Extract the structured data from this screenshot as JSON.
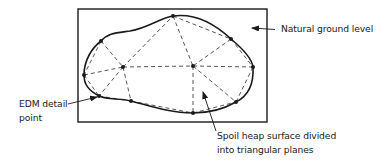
{
  "diagram": {
    "frame": {
      "x": 78,
      "y": 9,
      "w": 189,
      "h": 113
    },
    "colors": {
      "stroke": "#1a1a1a",
      "dash": "#444444",
      "text": "#222222",
      "background": "#ffffff"
    },
    "points": [
      {
        "id": "P1",
        "x": 101,
        "y": 41
      },
      {
        "id": "P2",
        "x": 84,
        "y": 75
      },
      {
        "id": "P3",
        "x": 123,
        "y": 67
      },
      {
        "id": "P4",
        "x": 173,
        "y": 16
      },
      {
        "id": "P5",
        "x": 231,
        "y": 39
      },
      {
        "id": "P6",
        "x": 253,
        "y": 67
      },
      {
        "id": "P7",
        "x": 193,
        "y": 66
      },
      {
        "id": "P8",
        "x": 99,
        "y": 96
      },
      {
        "id": "P9",
        "x": 131,
        "y": 101
      },
      {
        "id": "P10",
        "x": 193,
        "y": 113
      },
      {
        "id": "P11",
        "x": 236,
        "y": 102
      }
    ],
    "triangle_edges": [
      [
        "P1",
        "P2"
      ],
      [
        "P1",
        "P3"
      ],
      [
        "P2",
        "P3"
      ],
      [
        "P3",
        "P4"
      ],
      [
        "P3",
        "P7"
      ],
      [
        "P4",
        "P7"
      ],
      [
        "P4",
        "P5"
      ],
      [
        "P5",
        "P7"
      ],
      [
        "P5",
        "P6"
      ],
      [
        "P6",
        "P7"
      ],
      [
        "P2",
        "P8"
      ],
      [
        "P3",
        "P8"
      ],
      [
        "P3",
        "P9"
      ],
      [
        "P8",
        "P9"
      ],
      [
        "P7",
        "P10"
      ],
      [
        "P7",
        "P11"
      ],
      [
        "P6",
        "P11"
      ],
      [
        "P10",
        "P11"
      ],
      [
        "P9",
        "P10"
      ]
    ],
    "labels": {
      "natural_ground": "Natural ground level",
      "edm_line1": "EDM detail",
      "edm_line2": "point",
      "spoil_line1": "Spoil heap surface divided",
      "spoil_line2": "into triangular planes"
    }
  }
}
